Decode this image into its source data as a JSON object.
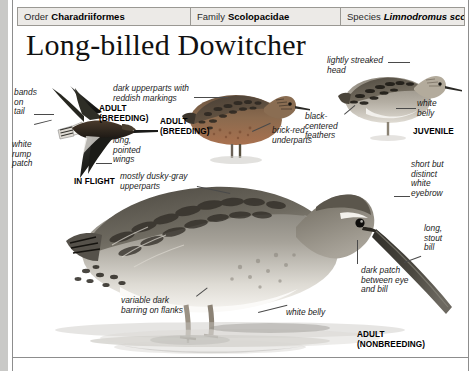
{
  "page": {
    "background": "#c9c9c7",
    "paper": "#ffffff"
  },
  "taxonomy": {
    "order": {
      "key": "Order",
      "value": "Charadriiformes"
    },
    "family": {
      "key": "Family",
      "value": "Scolopacidae"
    },
    "species": {
      "key": "Species",
      "value": "Limnodromus scolopaceus"
    }
  },
  "title": "Long-billed Dowitcher",
  "plates": [
    {
      "id": "in-flight",
      "label": "IN FLIGHT",
      "age_label": "ADULT\n(BREEDING)"
    },
    {
      "id": "adult-breeding",
      "label": "ADULT\n(BREEDING)"
    },
    {
      "id": "juvenile",
      "label": "JUVENILE"
    },
    {
      "id": "adult-nonbreeding",
      "label": "ADULT\n(NONBREEDING)"
    }
  ],
  "annotations": [
    {
      "id": "bands-on-tail",
      "text": "bands\non\ntail"
    },
    {
      "id": "white-rump-patch",
      "text": "white\nrump\npatch"
    },
    {
      "id": "long-pointed-wings",
      "text": "long,\npointed\nwings"
    },
    {
      "id": "dark-upperparts",
      "text": "dark upperparts with\nreddish markings"
    },
    {
      "id": "brick-red-underparts",
      "text": "brick-red\nunderparts"
    },
    {
      "id": "lightly-streaked-head",
      "text": "lightly streaked\nhead"
    },
    {
      "id": "white-belly-juvenile",
      "text": "white\nbelly"
    },
    {
      "id": "black-centered-feathers",
      "text": "black-\ncentered\nfeathers"
    },
    {
      "id": "mostly-dusky-gray",
      "text": "mostly dusky-gray\nupperparts"
    },
    {
      "id": "white-eyebrow",
      "text": "short but\ndistinct\nwhite\neyebrow"
    },
    {
      "id": "long-stout-bill",
      "text": "long,\nstout\nbill"
    },
    {
      "id": "dark-patch",
      "text": "dark patch\nbetween eye\nand bill"
    },
    {
      "id": "variable-dark-barring",
      "text": "variable dark\nbarring on flanks"
    },
    {
      "id": "white-belly-adult",
      "text": "white belly"
    }
  ],
  "colors": {
    "header_bg": "#eceae7",
    "header_border": "#9a9893",
    "text": "#1b1b1b",
    "leader_line": "#4a4a4a",
    "breeding_plumage": "#8a5236",
    "nonbreeding_plumage": "#8e8d88"
  }
}
